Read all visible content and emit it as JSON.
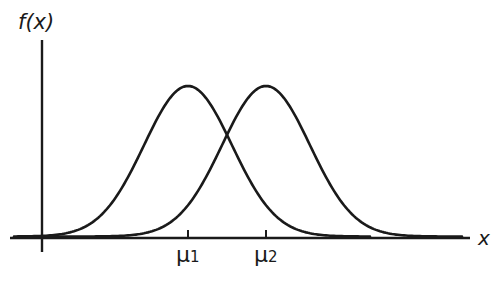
{
  "chart_data": {
    "type": "line",
    "title": "",
    "xlabel": "x",
    "ylabel": "f(x)",
    "grid": false,
    "legend": null,
    "tick_labels": [
      "μ1",
      "μ2"
    ],
    "series": [
      {
        "name": "f(x) centered at μ1",
        "mean_label": "μ1",
        "shape": "normal",
        "peak_px_x": 188,
        "sigma_px": 44
      },
      {
        "name": "f(x) centered at μ2",
        "mean_label": "μ2",
        "shape": "normal",
        "peak_px_x": 266,
        "sigma_px": 44
      }
    ],
    "annotations": [
      "Two identical normal curves with equal variance, shifted means μ1 < μ2"
    ]
  },
  "labels": {
    "y_axis": "f(x)",
    "x_axis": "x",
    "mu1": "μ",
    "mu1_sub": "1",
    "mu2": "μ",
    "mu2_sub": "2"
  },
  "style": {
    "ink": "#1a1a1a",
    "background": "#ffffff"
  }
}
